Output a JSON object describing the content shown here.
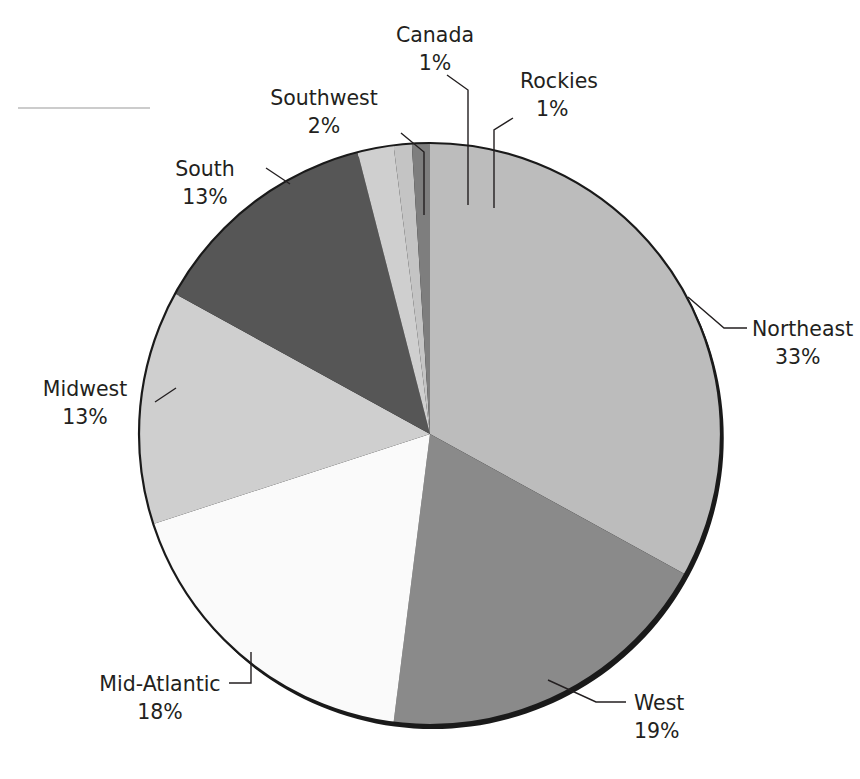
{
  "chart_data": {
    "type": "pie",
    "title": "",
    "subtitle": "",
    "xlabel": "",
    "ylabel": "",
    "legend_position": "none",
    "labels_position": "outside-with-leader-lines",
    "grid": false,
    "units": "percent",
    "start_angle_deg": 0,
    "direction": "clockwise",
    "categories": [
      "Northeast",
      "West",
      "Mid-Atlantic",
      "Midwest",
      "South",
      "Southwest",
      "Canada",
      "Rockies"
    ],
    "values": [
      33,
      19,
      18,
      13,
      13,
      2,
      1,
      1
    ],
    "value_labels": [
      "33%",
      "19%",
      "18%",
      "13%",
      "13%",
      "2%",
      "1%",
      "1%"
    ],
    "colors": [
      "#bcbcbc",
      "#8a8a8a",
      "#fafafa",
      "#cfcfcf",
      "#565656",
      "#cfcfcf",
      "#c4c4c4",
      "#7e7e7e"
    ],
    "slices": [
      {
        "name": "Northeast",
        "value": 33,
        "value_label": "33%",
        "color": "#bcbcbc"
      },
      {
        "name": "West",
        "value": 19,
        "value_label": "19%",
        "color": "#8a8a8a"
      },
      {
        "name": "Mid-Atlantic",
        "value": 18,
        "value_label": "18%",
        "color": "#fafafa"
      },
      {
        "name": "Midwest",
        "value": 13,
        "value_label": "13%",
        "color": "#cfcfcf"
      },
      {
        "name": "South",
        "value": 13,
        "value_label": "13%",
        "color": "#565656"
      },
      {
        "name": "Southwest",
        "value": 2,
        "value_label": "2%",
        "color": "#cfcfcf"
      },
      {
        "name": "Canada",
        "value": 1,
        "value_label": "1%",
        "color": "#c4c4c4"
      },
      {
        "name": "Rockies",
        "value": 1,
        "value_label": "1%",
        "color": "#7e7e7e"
      }
    ]
  },
  "labels": {
    "northeast": {
      "name": "Northeast",
      "value": "33%"
    },
    "west": {
      "name": "West",
      "value": "19%"
    },
    "midatlantic": {
      "name": "Mid-Atlantic",
      "value": "18%"
    },
    "midwest": {
      "name": "Midwest",
      "value": "13%"
    },
    "south": {
      "name": "South",
      "value": "13%"
    },
    "southwest": {
      "name": "Southwest",
      "value": "2%"
    },
    "canada": {
      "name": "Canada",
      "value": "1%"
    },
    "rockies": {
      "name": "Rockies",
      "value": "1%"
    }
  }
}
